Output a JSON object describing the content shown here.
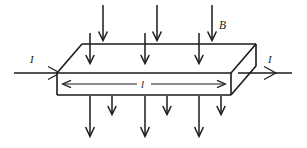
{
  "figure": {
    "background_color": "#ffffff",
    "ink_color": "#1a1a1a"
  },
  "labels": {
    "magnetic_field": "B",
    "current_in": "I",
    "current_out": "I",
    "length": "l"
  },
  "geometry": {
    "top_face": {
      "front_left": [
        57,
        73
      ],
      "back_left": [
        82,
        44
      ],
      "back_right": [
        256,
        44
      ],
      "front_right": [
        231,
        73
      ]
    },
    "front_face": {
      "top_left": [
        57,
        73
      ],
      "top_right": [
        231,
        73
      ],
      "bottom_right": [
        231,
        95
      ],
      "bottom_left": [
        57,
        95
      ]
    },
    "right_face": {
      "front_top": [
        231,
        73
      ],
      "back_top": [
        256,
        44
      ],
      "back_bottom": [
        256,
        66
      ],
      "front_bottom": [
        231,
        95
      ]
    }
  },
  "field_arrows": {
    "direction": "down",
    "above_slab_long": [
      {
        "x": 103,
        "y_start": 5,
        "y_end": 40
      },
      {
        "x": 157,
        "y_start": 5,
        "y_end": 40
      },
      {
        "x": 212,
        "y_start": 5,
        "y_end": 40
      }
    ],
    "above_slab_short": [
      {
        "x": 90,
        "y_start": 33,
        "y_end": 63
      },
      {
        "x": 145,
        "y_start": 33,
        "y_end": 63
      },
      {
        "x": 199,
        "y_start": 33,
        "y_end": 63
      }
    ],
    "below_slab_long": [
      {
        "x": 90,
        "y_start": 96,
        "y_end": 136
      },
      {
        "x": 145,
        "y_start": 96,
        "y_end": 136
      },
      {
        "x": 199,
        "y_start": 96,
        "y_end": 136
      }
    ],
    "below_slab_short": [
      {
        "x": 112,
        "y_start": 96,
        "y_end": 114
      },
      {
        "x": 167,
        "y_start": 96,
        "y_end": 114
      },
      {
        "x": 221,
        "y_start": 96,
        "y_end": 114
      }
    ]
  },
  "current_arrows": {
    "left": {
      "x_start": 14,
      "x_end": 62,
      "y": 73,
      "direction": "right"
    },
    "right": {
      "x_start": 238,
      "x_end": 292,
      "y": 73,
      "direction": "right"
    }
  },
  "dimension": {
    "y": 84,
    "x_start": 63,
    "x_end": 225,
    "label_x": 144,
    "double_headed": true
  }
}
